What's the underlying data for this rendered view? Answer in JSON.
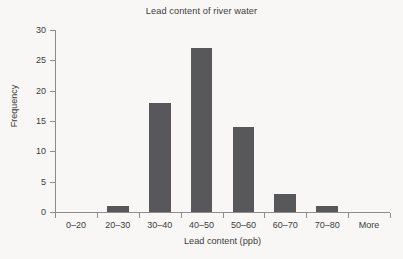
{
  "chart_data": {
    "type": "bar",
    "title": "Lead content of river water",
    "xlabel": "Lead content (ppb)",
    "ylabel": "Frequency",
    "categories": [
      "0–20",
      "20–30",
      "30–40",
      "40–50",
      "50–60",
      "60–70",
      "70–80",
      "More"
    ],
    "values": [
      0,
      1,
      18,
      27,
      14,
      3,
      1,
      0
    ],
    "ylim": [
      0,
      30
    ],
    "ytick_labels": [
      "0",
      "5",
      "10",
      "15",
      "20",
      "25",
      "30"
    ],
    "ytick_values": [
      0,
      5,
      10,
      15,
      20,
      25,
      30
    ],
    "grid": false,
    "legend": false,
    "bar_color": "#58585a",
    "axis_color": "#8d8d8d",
    "background_color": "#f8f7f5"
  }
}
